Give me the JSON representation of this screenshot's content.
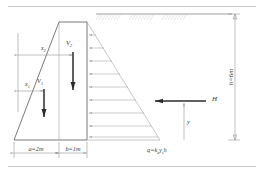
{
  "figure": {
    "labels": {
      "x1": "x",
      "x1_sub": "1",
      "x2": "x",
      "x2_sub": "2",
      "v1": "V",
      "v1_sub": "1",
      "v2": "V",
      "v2_sub": "2",
      "h_force": "H",
      "y_depth": "y",
      "height_dim": "h=6m",
      "base_dim_a": "a=2m",
      "base_dim_b": "b=1m",
      "pressure_formula_q": "q=",
      "pressure_formula_ka": "k",
      "pressure_formula_ka_sub": "a",
      "pressure_formula_gamma": "γ",
      "pressure_formula_gamma_sub": "s",
      "pressure_formula_h": "h"
    },
    "colors": {
      "line": "#6c6c6c",
      "thin_line": "#9a9a9a",
      "heavy_arrow": "#2b2b2b",
      "dimension": "#8d8d8d",
      "hatch": "#c2c2c2",
      "text": "#3a3a3a",
      "background": "#ffffff"
    },
    "geometry": {
      "wall_top_y": 22,
      "wall_base_y": 140,
      "base_left_x": 14,
      "wall_left_x": 59,
      "wall_right_x": 87,
      "pressure_base_x": 160,
      "height_dim_x": 235,
      "pressure_arrow_count": 9
    }
  }
}
